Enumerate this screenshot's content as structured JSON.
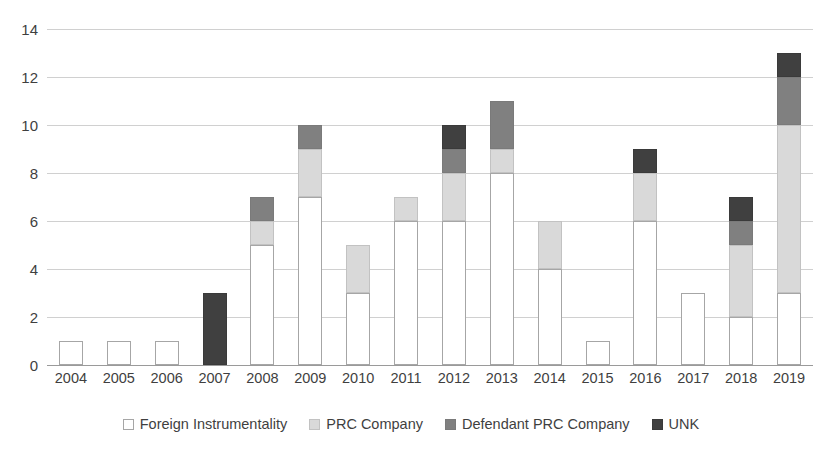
{
  "chart_data": {
    "type": "bar",
    "stacked": true,
    "title": "",
    "subtitle": "",
    "xlabel": "",
    "ylabel": "",
    "ylim": [
      0,
      14
    ],
    "ytick_step": 2,
    "yticks": [
      "14",
      "12",
      "10",
      "8",
      "6",
      "4",
      "2",
      "0"
    ],
    "grid": true,
    "legend_position": "bottom",
    "categories": [
      "2004",
      "2005",
      "2006",
      "2007",
      "2008",
      "2009",
      "2010",
      "2011",
      "2012",
      "2013",
      "2014",
      "2015",
      "2016",
      "2017",
      "2018",
      "2019"
    ],
    "series": [
      {
        "name": "Foreign Instrumentality",
        "color": "#ffffff",
        "border": "#a6a6a6",
        "values": [
          1,
          1,
          1,
          0,
          5,
          7,
          3,
          6,
          6,
          8,
          4,
          1,
          6,
          3,
          2,
          3
        ]
      },
      {
        "name": "PRC Company",
        "color": "#d9d9d9",
        "border": "#c2c2c2",
        "values": [
          0,
          0,
          0,
          0,
          1,
          2,
          2,
          1,
          2,
          1,
          2,
          0,
          2,
          0,
          3,
          7
        ]
      },
      {
        "name": "Defendant PRC Company",
        "color": "#808080",
        "border": "#7a7a7a",
        "values": [
          0,
          0,
          0,
          0,
          1,
          1,
          0,
          0,
          1,
          2,
          0,
          0,
          0,
          0,
          1,
          2
        ]
      },
      {
        "name": "UNK",
        "color": "#404040",
        "border": "#3a3a3a",
        "values": [
          0,
          0,
          0,
          3,
          0,
          0,
          0,
          0,
          1,
          0,
          0,
          0,
          1,
          0,
          1,
          1
        ]
      }
    ],
    "totals": [
      1,
      1,
      1,
      3,
      7,
      10,
      5,
      7,
      10,
      11,
      6,
      1,
      9,
      3,
      7,
      13
    ]
  },
  "legend": {
    "items": [
      {
        "label": "Foreign Instrumentality",
        "key": "foreign"
      },
      {
        "label": "PRC Company",
        "key": "prc"
      },
      {
        "label": "Defendant PRC Company",
        "key": "defprc"
      },
      {
        "label": "UNK",
        "key": "unk"
      }
    ]
  },
  "colors": {
    "foreign": "#ffffff",
    "prc": "#d9d9d9",
    "defprc": "#808080",
    "unk": "#404040",
    "gridline": "#d0d0d0",
    "axis": "#9a9a9a",
    "text": "#3f3f3f"
  }
}
